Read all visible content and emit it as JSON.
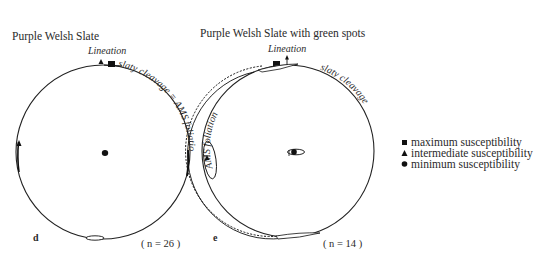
{
  "panels": [
    {
      "id": "d",
      "title": "Purple Welsh Slate",
      "panel_label": "d",
      "n_label": "( n = 26 )",
      "lineation_label": "Lineation",
      "arc_label": "slaty cleavage = AMS foliation"
    },
    {
      "id": "e",
      "title": "Purple Welsh Slate with green spots",
      "panel_label": "e",
      "n_label": "( n = 14 )",
      "lineation_label": "Lineation",
      "arc_label_right": "slaty cleavage",
      "arc_label_left": "AMS foliation"
    }
  ],
  "legend": {
    "items": [
      {
        "symbol": "square",
        "label": "maximum susceptibility"
      },
      {
        "symbol": "triangle",
        "label": "intermediate susceptibility"
      },
      {
        "symbol": "circle",
        "label": "minimum susceptibility"
      }
    ]
  }
}
